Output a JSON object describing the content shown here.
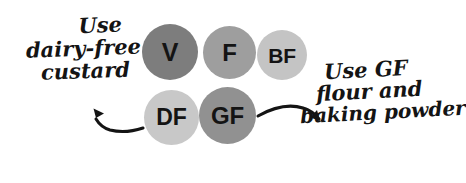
{
  "diagram": {
    "background_color": "#ffffff",
    "ink_color": "#141414",
    "badges": [
      {
        "id": "v",
        "label": "V",
        "name": "badge-vegan",
        "color": "#7d7d7d",
        "row": "top",
        "order": 1
      },
      {
        "id": "f",
        "label": "F",
        "name": "badge-freezable",
        "color": "#9e9e9e",
        "row": "top",
        "order": 2
      },
      {
        "id": "bf",
        "label": "BF",
        "name": "badge-batch-friendly",
        "color": "#c4c4c4",
        "row": "top",
        "order": 3
      },
      {
        "id": "df",
        "label": "DF",
        "name": "badge-dairy-free",
        "color": "#c8c8c8",
        "row": "bottom",
        "order": 1
      },
      {
        "id": "gf",
        "label": "GF",
        "name": "badge-gluten-free",
        "color": "#919191",
        "row": "bottom",
        "order": 2
      }
    ],
    "annotations": {
      "left": {
        "target_badge": "df",
        "arrow": "curved-arrow-left",
        "lines": [
          "Use",
          "dairy-free",
          "custard"
        ],
        "line1": "Use",
        "line2": "dairy-free",
        "line3": "custard"
      },
      "right": {
        "target_badge": "gf",
        "arrow": "curved-arrow-right",
        "lines": [
          "Use GF",
          "flour and",
          "baking powder"
        ],
        "line1": "Use GF",
        "line2": "flour and",
        "line3": "baking powder"
      }
    }
  }
}
